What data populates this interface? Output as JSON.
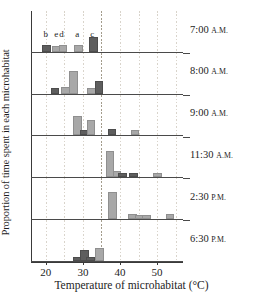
{
  "figure": {
    "title": "",
    "ylabel": "Proportion of time spent in each microhabitat",
    "xlabel": "Temperature of microhabitat (°C)"
  },
  "axis": {
    "xticks": [
      {
        "value": 20,
        "label": "20"
      },
      {
        "value": 30,
        "label": "30"
      },
      {
        "value": 40,
        "label": "40"
      },
      {
        "value": 50,
        "label": "50"
      }
    ],
    "xmin": 16,
    "xmax": 57
  },
  "habitat_letters": [
    {
      "label": "b",
      "temp": 20.0
    },
    {
      "label": "e",
      "temp": 22.8
    },
    {
      "label": "d",
      "temp": 24.2
    },
    {
      "label": "a",
      "temp": 28.5
    },
    {
      "label": "c",
      "temp": 32.5
    }
  ],
  "panel_labels": [
    {
      "time": "7:00",
      "period": "A.M."
    },
    {
      "time": "8:00",
      "period": "A.M."
    },
    {
      "time": "9:00",
      "period": "A.M."
    },
    {
      "time": "11:30",
      "period": "A.M."
    },
    {
      "time": "2:30",
      "period": "P.M."
    },
    {
      "time": "6:30",
      "period": "P.M."
    }
  ],
  "colors": {
    "light_bar": "#a8a8a8",
    "dark_bar": "#5e5e5e",
    "axis": "#3a3a3a",
    "grid_faint": "#d9d4cb",
    "grid_strong": "#a39c8c",
    "text": "#1d1d1d"
  },
  "chart_data": {
    "type": "bar",
    "title": "",
    "xlabel": "Temperature of microhabitat (°C)",
    "ylabel": "Proportion of time spent in each microhabitat",
    "xlim": [
      16,
      57
    ],
    "ylim": [
      0,
      1
    ],
    "grid": true,
    "gridlines_x": [
      20,
      25,
      30,
      35,
      40,
      45,
      50,
      55
    ],
    "emphasized_gridline_x": 35,
    "legend": "none",
    "panel_count": 6,
    "bar_width_c": 1.8,
    "panels": [
      {
        "label": "7:00 A.M.",
        "annotations": [
          {
            "text": "b",
            "x": 20.0
          },
          {
            "text": "e",
            "x": 22.8
          },
          {
            "text": "d",
            "x": 24.2
          },
          {
            "text": "a",
            "x": 28.5
          },
          {
            "text": "c",
            "x": 32.5
          }
        ],
        "bars": [
          {
            "x": 20.0,
            "value": 0.13,
            "shade": "dark"
          },
          {
            "x": 22.6,
            "value": 0.11,
            "shade": "light"
          },
          {
            "x": 24.4,
            "value": 0.12,
            "shade": "light"
          },
          {
            "x": 28.5,
            "value": 0.13,
            "shade": "light"
          },
          {
            "x": 32.5,
            "value": 0.32,
            "shade": "dark"
          }
        ]
      },
      {
        "label": "8:00 A.M.",
        "annotations": [],
        "bars": [
          {
            "x": 22.2,
            "value": 0.1,
            "shade": "dark"
          },
          {
            "x": 25.0,
            "value": 0.11,
            "shade": "light"
          },
          {
            "x": 27.2,
            "value": 0.53,
            "shade": "light"
          },
          {
            "x": 32.0,
            "value": 0.1,
            "shade": "light"
          },
          {
            "x": 34.1,
            "value": 0.27,
            "shade": "dark"
          }
        ]
      },
      {
        "label": "9:00 A.M.",
        "annotations": [],
        "bars": [
          {
            "x": 28.2,
            "value": 0.45,
            "shade": "light"
          },
          {
            "x": 30.1,
            "value": 0.09,
            "shade": "dark"
          },
          {
            "x": 31.9,
            "value": 0.34,
            "shade": "light"
          },
          {
            "x": 37.6,
            "value": 0.12,
            "shade": "dark"
          },
          {
            "x": 43.8,
            "value": 0.08,
            "shade": "light"
          }
        ]
      },
      {
        "label": "11:30 A.M.",
        "annotations": [],
        "bars": [
          {
            "x": 37.0,
            "value": 0.62,
            "shade": "light"
          },
          {
            "x": 38.9,
            "value": 0.12,
            "shade": "light"
          },
          {
            "x": 40.5,
            "value": 0.07,
            "shade": "dark"
          },
          {
            "x": 43.3,
            "value": 0.06,
            "shade": "dark"
          },
          {
            "x": 49.8,
            "value": 0.06,
            "shade": "light"
          }
        ]
      },
      {
        "label": "2:30 P.M.",
        "annotations": [],
        "bars": [
          {
            "x": 37.8,
            "value": 0.66,
            "shade": "light"
          },
          {
            "x": 43.1,
            "value": 0.07,
            "shade": "light"
          },
          {
            "x": 45.0,
            "value": 0.06,
            "shade": "light"
          },
          {
            "x": 46.9,
            "value": 0.06,
            "shade": "light"
          },
          {
            "x": 53.2,
            "value": 0.07,
            "shade": "light"
          }
        ]
      },
      {
        "label": "6:30 P.M.",
        "annotations": [],
        "bars": [
          {
            "x": 28.3,
            "value": 0.06,
            "shade": "dark"
          },
          {
            "x": 30.2,
            "value": 0.22,
            "shade": "dark"
          },
          {
            "x": 31.8,
            "value": 0.04,
            "shade": "dark"
          },
          {
            "x": 34.2,
            "value": 0.29,
            "shade": "light"
          }
        ]
      }
    ]
  }
}
